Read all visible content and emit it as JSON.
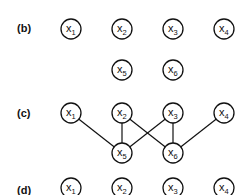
{
  "panels": [
    {
      "label": "(b)",
      "label_pos": [
        17,
        32
      ],
      "nodes": [
        {
          "id": "x1",
          "var": "X",
          "sub": "1",
          "cx": 71,
          "cy": 29
        },
        {
          "id": "x2",
          "var": "X",
          "sub": "2",
          "cx": 122,
          "cy": 29
        },
        {
          "id": "x3",
          "var": "X",
          "sub": "3",
          "cx": 173,
          "cy": 29
        },
        {
          "id": "x4",
          "var": "X",
          "sub": "4",
          "cx": 224,
          "cy": 29
        },
        {
          "id": "x5",
          "var": "X",
          "sub": "5",
          "cx": 122,
          "cy": 70
        },
        {
          "id": "x6",
          "var": "X",
          "sub": "6",
          "cx": 173,
          "cy": 70
        }
      ],
      "edges": []
    },
    {
      "label": "(c)",
      "label_pos": [
        17,
        117
      ],
      "nodes": [
        {
          "id": "x1",
          "var": "X",
          "sub": "1",
          "cx": 71,
          "cy": 113
        },
        {
          "id": "x2",
          "var": "X",
          "sub": "2",
          "cx": 122,
          "cy": 113
        },
        {
          "id": "x3",
          "var": "X",
          "sub": "3",
          "cx": 173,
          "cy": 113
        },
        {
          "id": "x4",
          "var": "X",
          "sub": "4",
          "cx": 224,
          "cy": 113
        },
        {
          "id": "x5",
          "var": "X",
          "sub": "5",
          "cx": 122,
          "cy": 153
        },
        {
          "id": "x6",
          "var": "X",
          "sub": "6",
          "cx": 173,
          "cy": 153
        }
      ],
      "edges": [
        [
          "x1",
          "x5"
        ],
        [
          "x2",
          "x5"
        ],
        [
          "x2",
          "x6"
        ],
        [
          "x3",
          "x5"
        ],
        [
          "x3",
          "x6"
        ],
        [
          "x4",
          "x6"
        ]
      ]
    },
    {
      "label": "(d)",
      "label_pos": [
        17,
        194
      ],
      "nodes": [
        {
          "id": "x1",
          "var": "X",
          "sub": "1",
          "cx": 71,
          "cy": 188
        },
        {
          "id": "x2",
          "var": "X",
          "sub": "2",
          "cx": 122,
          "cy": 188
        },
        {
          "id": "x3",
          "var": "X",
          "sub": "3",
          "cx": 173,
          "cy": 188
        },
        {
          "id": "x4",
          "var": "X",
          "sub": "4",
          "cx": 224,
          "cy": 188
        }
      ],
      "edges": []
    }
  ],
  "node_radius": 10
}
